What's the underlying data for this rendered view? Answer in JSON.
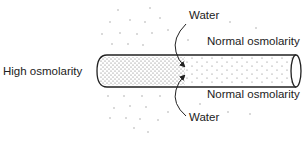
{
  "diagram": {
    "left_label": "High osmolarity",
    "top_water_label": "Water",
    "bottom_water_label": "Water",
    "top_right_label": "Normal osmolarity",
    "bottom_right_label": "Normal osmolarity",
    "colors": {
      "ink": "#222222",
      "stipple": "#555555",
      "background": "#ffffff"
    }
  }
}
